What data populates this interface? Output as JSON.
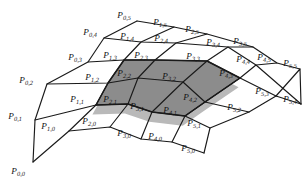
{
  "figure": {
    "kind": "control-point-mesh-diagram",
    "colors": {
      "background": "#ffffff",
      "line": "#1a1a1a",
      "shade_fill": "#8c8c8c",
      "shade_fill_soft": "#b9b9b9",
      "label_text": "#141414"
    },
    "grid": {
      "rows": 6,
      "cols": 6,
      "i_range": [
        0,
        5
      ],
      "j_range": [
        0,
        5
      ]
    }
  },
  "labels": [
    {
      "name": "P00",
      "base": "P",
      "sub": "0,0",
      "x": 18,
      "y": 172,
      "text": "P0,0"
    },
    {
      "name": "P01",
      "base": "P",
      "sub": "0,1",
      "x": 15,
      "y": 117,
      "text": "P0,1"
    },
    {
      "name": "P02",
      "base": "P",
      "sub": "0,2",
      "x": 26,
      "y": 81,
      "text": "P0,2"
    },
    {
      "name": "P03",
      "base": "P",
      "sub": "0,3",
      "x": 75,
      "y": 58,
      "text": "P0,3"
    },
    {
      "name": "P04",
      "base": "P",
      "sub": "0,4",
      "x": 90,
      "y": 33,
      "text": "P0,4"
    },
    {
      "name": "P05",
      "base": "P",
      "sub": "0,5",
      "x": 124,
      "y": 16,
      "text": "P0,5"
    },
    {
      "name": "P10",
      "base": "P",
      "sub": "1,0",
      "x": 48,
      "y": 127,
      "text": "P1,0"
    },
    {
      "name": "P11",
      "base": "P",
      "sub": "1,1",
      "x": 77,
      "y": 100,
      "text": "P1,1"
    },
    {
      "name": "P12",
      "base": "P",
      "sub": "1,2",
      "x": 92,
      "y": 78,
      "text": "P1,2"
    },
    {
      "name": "P13",
      "base": "P",
      "sub": "1,3",
      "x": 110,
      "y": 56,
      "text": "P1,3"
    },
    {
      "name": "P14",
      "base": "P",
      "sub": "1,4",
      "x": 127,
      "y": 37,
      "text": "P1,4"
    },
    {
      "name": "P15",
      "base": "P",
      "sub": "1,5",
      "x": 160,
      "y": 23,
      "text": "P1,5"
    },
    {
      "name": "P20",
      "base": "P",
      "sub": "2,0",
      "x": 89,
      "y": 122,
      "text": "P2,0"
    },
    {
      "name": "P21",
      "base": "P",
      "sub": "2,1",
      "x": 110,
      "y": 100,
      "text": "P2,1"
    },
    {
      "name": "P22",
      "base": "P",
      "sub": "2,2",
      "x": 124,
      "y": 74,
      "text": "P2,2"
    },
    {
      "name": "P23",
      "base": "P",
      "sub": "2,3",
      "x": 141,
      "y": 56,
      "text": "P2,3"
    },
    {
      "name": "P24",
      "base": "P",
      "sub": "2,4",
      "x": 161,
      "y": 39,
      "text": "P2,4"
    },
    {
      "name": "P25",
      "base": "P",
      "sub": "2,5",
      "x": 192,
      "y": 30,
      "text": "P2,5"
    },
    {
      "name": "P30",
      "base": "P",
      "sub": "3,0",
      "x": 124,
      "y": 134,
      "text": "P3,0"
    },
    {
      "name": "P31",
      "base": "P",
      "sub": "3,1",
      "x": 137,
      "y": 107,
      "text": "P3,1"
    },
    {
      "name": "P32",
      "base": "P",
      "sub": "3,2",
      "x": 169,
      "y": 77,
      "text": "P3,2"
    },
    {
      "name": "P33",
      "base": "P",
      "sub": "3,3",
      "x": 193,
      "y": 57,
      "text": "P3,3"
    },
    {
      "name": "P34",
      "base": "P",
      "sub": "3,4",
      "x": 213,
      "y": 43,
      "text": "P3,4"
    },
    {
      "name": "P35",
      "base": "P",
      "sub": "3,5",
      "x": 240,
      "y": 42,
      "text": "P3,5"
    },
    {
      "name": "P40",
      "base": "P",
      "sub": "4,0",
      "x": 155,
      "y": 137,
      "text": "P4,0"
    },
    {
      "name": "P41",
      "base": "P",
      "sub": "4,1",
      "x": 170,
      "y": 111,
      "text": "P4,1"
    },
    {
      "name": "P42",
      "base": "P",
      "sub": "4,2",
      "x": 190,
      "y": 98,
      "text": "P4,2"
    },
    {
      "name": "P43",
      "base": "P",
      "sub": "4,3",
      "x": 226,
      "y": 74,
      "text": "P4,3"
    },
    {
      "name": "P44",
      "base": "P",
      "sub": "4,4",
      "x": 243,
      "y": 60,
      "text": "P4,4"
    },
    {
      "name": "P45",
      "base": "P",
      "sub": "4,5",
      "x": 264,
      "y": 58,
      "text": "P4,5"
    },
    {
      "name": "P50",
      "base": "P",
      "sub": "5,0",
      "x": 188,
      "y": 149,
      "text": "P5,0"
    },
    {
      "name": "P51",
      "base": "P",
      "sub": "5,1",
      "x": 194,
      "y": 124,
      "text": "P5,1"
    },
    {
      "name": "P52",
      "base": "P",
      "sub": "5,2",
      "x": 234,
      "y": 108,
      "text": "P5,2"
    },
    {
      "name": "P53",
      "base": "P",
      "sub": "5,3",
      "x": 262,
      "y": 92,
      "text": "P5,3"
    },
    {
      "name": "P54",
      "base": "P",
      "sub": "5,4",
      "x": 290,
      "y": 100,
      "text": "P5,4"
    },
    {
      "name": "P55",
      "base": "P",
      "sub": "5,5",
      "x": 290,
      "y": 64,
      "text": "P5,5"
    }
  ],
  "nodes": {
    "P00": [
      33,
      162
    ],
    "P01": [
      35,
      120
    ],
    "P02": [
      47,
      84
    ],
    "P03": [
      88,
      62
    ],
    "P04": [
      104,
      38
    ],
    "P05": [
      137,
      21
    ],
    "P10": [
      69,
      131
    ],
    "P11": [
      96,
      105
    ],
    "P12": [
      108,
      83
    ],
    "P13": [
      124,
      60
    ],
    "P14": [
      141,
      42
    ],
    "P15": [
      174,
      27
    ],
    "P20": [
      110,
      127
    ],
    "P21": [
      128,
      104
    ],
    "P22": [
      138,
      78
    ],
    "P23": [
      155,
      60
    ],
    "P24": [
      176,
      43
    ],
    "P25": [
      207,
      34
    ],
    "P30": [
      141,
      139
    ],
    "P31": [
      152,
      112
    ],
    "P32": [
      183,
      82
    ],
    "P33": [
      207,
      61
    ],
    "P34": [
      228,
      47
    ],
    "P35": [
      253,
      47
    ],
    "P40": [
      172,
      142
    ],
    "P41": [
      185,
      116
    ],
    "P42": [
      205,
      102
    ],
    "P43": [
      240,
      78
    ],
    "P44": [
      256,
      65
    ],
    "P45": [
      277,
      63
    ],
    "P50": [
      204,
      153
    ],
    "P51": [
      210,
      128
    ],
    "P52": [
      249,
      112
    ],
    "P53": [
      276,
      96
    ],
    "P54": [
      301,
      104
    ],
    "P55": [
      300,
      69
    ]
  },
  "shaded_region": {
    "name": "highlighted-subpatch",
    "fill": "#8c8c8c",
    "soft_fill": "#b9b9b9",
    "boundary_nodes": [
      "P11",
      "P21",
      "P31",
      "P41",
      "P42",
      "P43",
      "P33",
      "P23",
      "P13",
      "P12"
    ]
  }
}
